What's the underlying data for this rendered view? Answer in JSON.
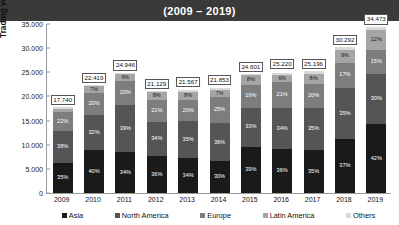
{
  "header": {
    "title": "(2009 – 2019)"
  },
  "chart_data": {
    "type": "bar",
    "subtype": "stacked-percent-with-totals",
    "title": "(2009 – 2019)",
    "xlabel": "",
    "ylabel": "Trading volume (million contracts)",
    "ylim": [
      0,
      35000
    ],
    "yticks": [
      0,
      5000,
      10000,
      15000,
      20000,
      25000,
      30000,
      35000
    ],
    "ytick_labels": [
      "0",
      "5.000",
      "10.000",
      "15.000",
      "20.000",
      "25.000",
      "30.000",
      "35.000"
    ],
    "grid": false,
    "legend_position": "bottom",
    "categories": [
      "2009",
      "2010",
      "2011",
      "2012",
      "2013",
      "2014",
      "2015",
      "2016",
      "2017",
      "2018",
      "2019"
    ],
    "totals": [
      17740,
      22419,
      24946,
      21129,
      21567,
      21853,
      24601,
      25220,
      25196,
      30292,
      34473
    ],
    "total_labels": [
      "17.740",
      "22.419",
      "24.946",
      "21.129",
      "21.567",
      "21.853",
      "24.601",
      "25.220",
      "25.196",
      "30.292",
      "34.473"
    ],
    "series": [
      {
        "name": "Asia",
        "color": "#1a1a1a",
        "values": [
          35,
          40,
          34,
          36,
          34,
          30,
          39,
          36,
          35,
          37,
          42
        ],
        "labels": [
          "35%",
          "40%",
          "34%",
          "36%",
          "34%",
          "30%",
          "39%",
          "36%",
          "35%",
          "37%",
          "42%"
        ]
      },
      {
        "name": "North America",
        "color": "#555555",
        "values": [
          38,
          32,
          39,
          34,
          35,
          36,
          33,
          34,
          35,
          35,
          30
        ],
        "labels": [
          "38%",
          "32%",
          "39%",
          "34%",
          "35%",
          "36%",
          "33%",
          "34%",
          "35%",
          "35%",
          "30%"
        ]
      },
      {
        "name": "Europe",
        "color": "#7d7d7d",
        "values": [
          22,
          20,
          20,
          21,
          20,
          25,
          19,
          21,
          20,
          17,
          15
        ],
        "labels": [
          "22%",
          "20%",
          "20%",
          "21%",
          "20%",
          "25%",
          "19%",
          "21%",
          "20%",
          "17%",
          "15%"
        ]
      },
      {
        "name": "Latin America",
        "color": "#a5a5a5",
        "values": [
          4,
          7,
          6,
          8,
          8,
          7,
          8,
          6,
          8,
          9,
          12
        ],
        "labels": [
          "4%",
          "7%",
          "6%",
          "8%",
          "8%",
          "7%",
          "8%",
          "6%",
          "8%",
          "9%",
          "12%"
        ]
      },
      {
        "name": "Others",
        "color": "#d9d9d9",
        "values": [
          2,
          1,
          1,
          1,
          2,
          2,
          1,
          2,
          2,
          2,
          2
        ],
        "labels": [
          "2%",
          "1%",
          "1%",
          "1%",
          "2%",
          "2%",
          "1%",
          "2%",
          "2%",
          "2%",
          "2%"
        ]
      }
    ]
  }
}
